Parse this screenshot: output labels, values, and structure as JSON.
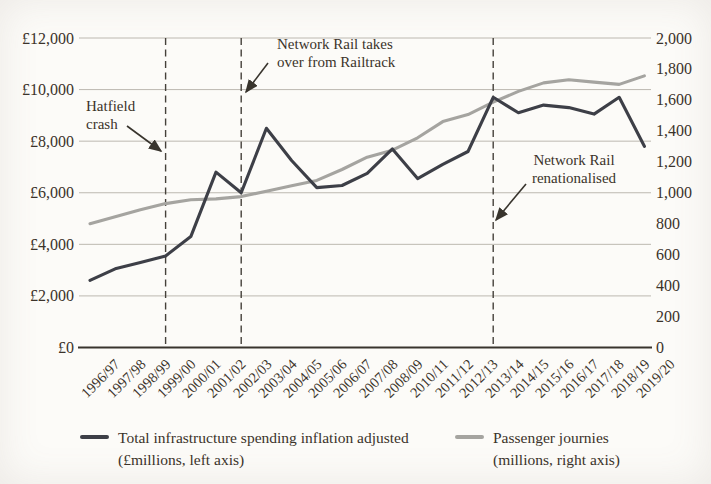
{
  "page": {
    "background": "#fcfbf8",
    "text_color": "#3b332a",
    "gridline_color": "#bcb8b0",
    "axis_line_color": "#38342d",
    "dashed_line_color": "#45413a",
    "arrow_color": "#38342d"
  },
  "chart_data": {
    "type": "line",
    "title": "",
    "categories": [
      "1996/97",
      "1997/98",
      "1998/99",
      "1999/00",
      "2000/01",
      "2001/02",
      "2002/03",
      "2003/04",
      "2004/05",
      "2005/06",
      "2006/07",
      "2007/08",
      "2008/09",
      "2010/11",
      "2011/12",
      "2012/13",
      "2013/14",
      "2014/15",
      "2015/16",
      "2016/17",
      "2017/18",
      "2018/19",
      "2019/20"
    ],
    "series": [
      {
        "name": "Total infrastructure spending inflation adjusted (£millions, left axis)",
        "axis": "left",
        "color": "#3d3f47",
        "values": [
          2600,
          3050,
          3300,
          3550,
          4300,
          6800,
          6000,
          8500,
          7250,
          6200,
          6280,
          6750,
          7700,
          6550,
          7100,
          7600,
          9700,
          9100,
          9400,
          9300,
          9050,
          9700,
          7800
        ]
      },
      {
        "name": "Passenger journies (millions, right axis)",
        "axis": "right",
        "color": "#a5a4a0",
        "values": [
          800,
          845,
          890,
          930,
          955,
          960,
          975,
          1010,
          1045,
          1080,
          1150,
          1230,
          1275,
          1355,
          1460,
          1505,
          1585,
          1655,
          1710,
          1730,
          1715,
          1700,
          1755
        ]
      }
    ],
    "left_axis": {
      "min": 0,
      "max": 12000,
      "step": 2000,
      "tick_labels": [
        "£12,000",
        "£10,000",
        "£8,000",
        "£6,000",
        "£4,000",
        "£2,000",
        "£0"
      ]
    },
    "right_axis": {
      "min": 0,
      "max": 2000,
      "step": 200,
      "tick_labels": [
        "2,000",
        "1,800",
        "1,600",
        "1,400",
        "1,200",
        "1,000",
        "800",
        "600",
        "400",
        "200",
        "0"
      ]
    },
    "gridlines": true,
    "legend_position": "bottom",
    "event_lines": [
      {
        "at": "1999/00",
        "annotation": "hatfield"
      },
      {
        "at": "2002/03",
        "annotation": "takeover"
      },
      {
        "at": "2013/14",
        "annotation": "renationalised"
      }
    ],
    "annotations": {
      "hatfield": {
        "line1": "Hatfield",
        "line2": "crash"
      },
      "takeover": {
        "line1": "Network Rail takes",
        "line2": "over from Railtrack"
      },
      "renationalised": {
        "line1": "Network Rail",
        "line2": "renationalised"
      }
    },
    "legend": {
      "spending": {
        "line1": "Total infrastructure spending inflation adjusted",
        "line2": "(£millions, left axis)"
      },
      "passengers": {
        "line1": "Passenger journies",
        "line2": "(millions, right axis)"
      }
    }
  }
}
